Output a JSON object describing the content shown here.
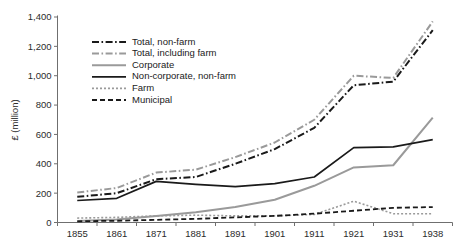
{
  "chart_data": {
    "type": "line",
    "title": "",
    "xlabel": "",
    "ylabel": "£ (million)",
    "categories": [
      "1855",
      "1861",
      "1871",
      "1881",
      "1891",
      "1901",
      "1911",
      "1921",
      "1931",
      "1938"
    ],
    "ylim": [
      0,
      1400
    ],
    "ytick_values": [
      0,
      200,
      400,
      600,
      800,
      1000,
      1200,
      1400
    ],
    "ytick_labels": [
      "0",
      "200",
      "400",
      "600",
      "800",
      "1,000",
      "1,200",
      "1,400"
    ],
    "grid": false,
    "legend_position": "upper-left-inside",
    "series": [
      {
        "name": "Total, non-farm",
        "color": "#1a1a1a",
        "dash": "dash-dot",
        "width": 2.0,
        "values": [
          175,
          200,
          295,
          310,
          400,
          500,
          645,
          935,
          960,
          1310
        ]
      },
      {
        "name": "Total, including farm",
        "color": "#9a9a9a",
        "dash": "dash-dot",
        "width": 2.0,
        "values": [
          205,
          235,
          340,
          360,
          445,
          545,
          700,
          1000,
          985,
          1370
        ]
      },
      {
        "name": "Corporate",
        "color": "#9a9a9a",
        "dash": "solid",
        "width": 2.0,
        "values": [
          10,
          20,
          45,
          70,
          105,
          155,
          250,
          375,
          390,
          715
        ]
      },
      {
        "name": "Non-corporate, non-farm",
        "color": "#1a1a1a",
        "dash": "solid",
        "width": 1.7,
        "values": [
          150,
          165,
          280,
          260,
          245,
          265,
          310,
          510,
          515,
          565
        ]
      },
      {
        "name": "Farm",
        "color": "#9a9a9a",
        "dash": "dotted",
        "width": 1.6,
        "values": [
          30,
          35,
          45,
          50,
          45,
          45,
          55,
          145,
          60,
          60
        ]
      },
      {
        "name": "Municipal",
        "color": "#1a1a1a",
        "dash": "dashed",
        "width": 1.8,
        "values": [
          8,
          12,
          18,
          25,
          35,
          45,
          60,
          80,
          100,
          105
        ]
      }
    ]
  },
  "legend": {
    "entries": [
      {
        "label": "Total, non-farm"
      },
      {
        "label": "Total, including farm"
      },
      {
        "label": "Corporate"
      },
      {
        "label": "Non-corporate, non-farm"
      },
      {
        "label": "Farm"
      },
      {
        "label": "Municipal"
      }
    ]
  },
  "axes": {
    "y_title": "£ (million)",
    "y_labels": [
      "1,400",
      "1,200",
      "1,000",
      "800",
      "600",
      "400",
      "200",
      "0"
    ],
    "x_labels": [
      "1855",
      "1861",
      "1871",
      "1881",
      "1891",
      "1901",
      "1911",
      "1921",
      "1931",
      "1938"
    ]
  }
}
